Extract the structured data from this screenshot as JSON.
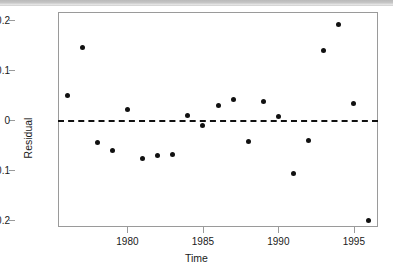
{
  "chart_data": {
    "type": "scatter",
    "title": "",
    "xlabel": "Time",
    "ylabel": "Residual",
    "xlim": [
      1975.4,
      1996.6
    ],
    "ylim": [
      -0.215,
      0.215
    ],
    "xticks": [
      1980,
      1985,
      1990,
      1995
    ],
    "xtick_labels": [
      "1980",
      "1985",
      "1990",
      "1995"
    ],
    "yticks": [
      0.2,
      0.1,
      0,
      -0.1,
      -0.2
    ],
    "ytick_labels": [
      "0.2",
      "0.1",
      "0",
      "−0.1",
      "−0.2"
    ],
    "grid": false,
    "legend": null,
    "point_color": "#111111",
    "point_shape": "filled-circle",
    "reference_line": {
      "orientation": "horizontal",
      "value": 0,
      "style": "dashed",
      "color": "#111111"
    },
    "x": [
      1976,
      1977,
      1978,
      1979,
      1980,
      1981,
      1982,
      1983,
      1984,
      1985,
      1986,
      1987,
      1988,
      1989,
      1990,
      1991,
      1992,
      1993,
      1994,
      1995,
      1996
    ],
    "values": [
      0.048,
      0.144,
      -0.046,
      -0.061,
      0.021,
      -0.078,
      -0.071,
      -0.07,
      0.009,
      -0.011,
      0.029,
      0.04,
      -0.043,
      0.037,
      0.007,
      -0.108,
      -0.042,
      0.138,
      0.19,
      0.033,
      -0.201
    ],
    "points": [
      {
        "x": 1976,
        "y": 0.048
      },
      {
        "x": 1977,
        "y": 0.144
      },
      {
        "x": 1978,
        "y": -0.046
      },
      {
        "x": 1979,
        "y": -0.061
      },
      {
        "x": 1980,
        "y": 0.021
      },
      {
        "x": 1981,
        "y": -0.078
      },
      {
        "x": 1982,
        "y": -0.071
      },
      {
        "x": 1983,
        "y": -0.07
      },
      {
        "x": 1984,
        "y": 0.009
      },
      {
        "x": 1985,
        "y": -0.011
      },
      {
        "x": 1986,
        "y": 0.029
      },
      {
        "x": 1987,
        "y": 0.04
      },
      {
        "x": 1988,
        "y": -0.043
      },
      {
        "x": 1989,
        "y": 0.037
      },
      {
        "x": 1990,
        "y": 0.007
      },
      {
        "x": 1991,
        "y": -0.108
      },
      {
        "x": 1992,
        "y": -0.042
      },
      {
        "x": 1993,
        "y": 0.138
      },
      {
        "x": 1994,
        "y": 0.19
      },
      {
        "x": 1995,
        "y": 0.033
      },
      {
        "x": 1996,
        "y": -0.201
      }
    ]
  }
}
